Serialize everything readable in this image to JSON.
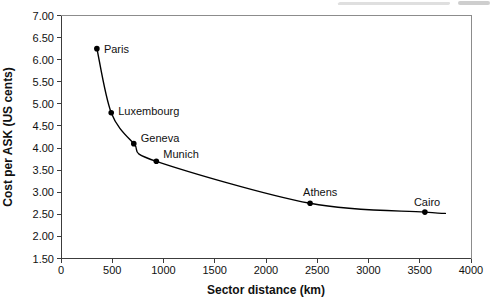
{
  "chart_data": {
    "type": "line",
    "title": "",
    "xlabel": "Sector distance (km)",
    "ylabel": "Cost per ASK (US cents)",
    "xlim": [
      0,
      4000
    ],
    "ylim": [
      1.5,
      7.0
    ],
    "x_ticks": [
      "0",
      "500",
      "1000",
      "1500",
      "2000",
      "2500",
      "3000",
      "3500",
      "4000"
    ],
    "y_ticks": [
      "1.50",
      "2.00",
      "2.50",
      "3.00",
      "3.50",
      "4.00",
      "4.50",
      "5.00",
      "5.50",
      "6.00",
      "6.50",
      "7.00"
    ],
    "grid": false,
    "legend": false,
    "series": [
      {
        "points": [
          {
            "city": "Paris",
            "x": 350,
            "y": 6.25,
            "label_dx": 7,
            "label_dy": 4
          },
          {
            "city": "Luxembourg",
            "x": 490,
            "y": 4.8,
            "label_dx": 7,
            "label_dy": 2
          },
          {
            "city": "Geneva",
            "x": 710,
            "y": 4.1,
            "label_dx": 7,
            "label_dy": -2
          },
          {
            "city": "Munich",
            "x": 930,
            "y": 3.7,
            "label_dx": 7,
            "label_dy": -3
          },
          {
            "city": "Athens",
            "x": 2430,
            "y": 2.75,
            "label_dx": -7,
            "label_dy": -7
          },
          {
            "city": "Cairo",
            "x": 3550,
            "y": 2.55,
            "label_dx": -11,
            "label_dy": -6
          }
        ],
        "curve_extends_to": {
          "x": 3750,
          "y": 2.52
        }
      }
    ],
    "colors": {
      "line": "#000000",
      "marker": "#000000",
      "frame": "#8c8c8c",
      "axis": "#3c3c3c",
      "text": "#111111"
    }
  }
}
